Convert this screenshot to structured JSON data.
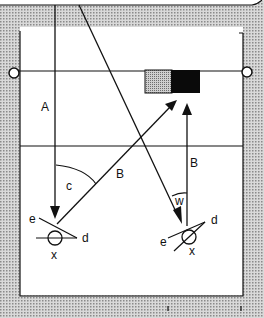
{
  "diagram": {
    "type": "geometry-schematic",
    "colors": {
      "line": "#111111",
      "background_pattern": "#bdbdbd",
      "panel": "#ffffff",
      "target_gray": "#9a9a9a",
      "target_black": "#0a0a0a"
    },
    "labels": {
      "A": "A",
      "B_diag": "B",
      "B_vert": "B",
      "c": "c",
      "w": "w",
      "e_left": "e",
      "d_left": "d",
      "x_left": "x",
      "e_right": "e",
      "d_right": "d",
      "x_right": "x"
    },
    "elements": {
      "top_horizontal_line": "horizontal reference line with circle endpoints",
      "middle_horizontal_line": "horizontal reference line",
      "target_box": "two-tone rectangle (gray + black)",
      "vector_A": "vertical arrow pointing down to left sensor",
      "vector_B_diag": "diagonal arrow from left sensor to target",
      "vector_B_vert": "vertical arrow from right sensor to target",
      "incoming_ray": "diagonal arrow from top to right sensor",
      "angle_c": "angle between A and diagonal B",
      "angle_w": "angle between incoming ray and vertical B"
    }
  }
}
